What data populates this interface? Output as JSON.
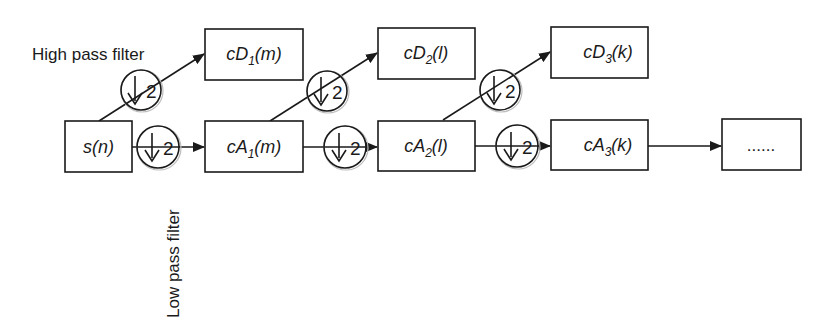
{
  "diagram": {
    "labels": {
      "high_pass": "High pass filter",
      "low_pass": "Low pass filter"
    },
    "downsample_factor": "2",
    "input": {
      "name": "s",
      "arg": "(n)"
    },
    "nodes": [
      {
        "id": "cD1",
        "prefix": "cD",
        "sub": "1",
        "arg": "(m)",
        "type": "detail"
      },
      {
        "id": "cA1",
        "prefix": "cA",
        "sub": "1",
        "arg": "(m)",
        "type": "approximation"
      },
      {
        "id": "cD2",
        "prefix": "cD",
        "sub": "2",
        "arg": "(l)",
        "type": "detail"
      },
      {
        "id": "cA2",
        "prefix": "cA",
        "sub": "2",
        "arg": "(l)",
        "type": "approximation"
      },
      {
        "id": "cD3",
        "prefix": "cD",
        "sub": "3",
        "arg": "(k)",
        "type": "detail"
      },
      {
        "id": "cA3",
        "prefix": "cA",
        "sub": "3",
        "arg": "(k)",
        "type": "approximation"
      }
    ],
    "continuation": "......",
    "edges": [
      {
        "from": "s(n)",
        "to": "cD1",
        "filter": "high pass",
        "downsample": "↓2"
      },
      {
        "from": "s(n)",
        "to": "cA1",
        "filter": "low pass",
        "downsample": "↓2"
      },
      {
        "from": "cA1",
        "to": "cD2",
        "filter": "high pass",
        "downsample": "↓2"
      },
      {
        "from": "cA1",
        "to": "cA2",
        "filter": "low pass",
        "downsample": "↓2"
      },
      {
        "from": "cA2",
        "to": "cD3",
        "filter": "high pass",
        "downsample": "↓2"
      },
      {
        "from": "cA2",
        "to": "cA3",
        "filter": "low pass",
        "downsample": "↓2"
      },
      {
        "from": "cA3",
        "to": "......",
        "filter": "",
        "downsample": ""
      }
    ]
  }
}
